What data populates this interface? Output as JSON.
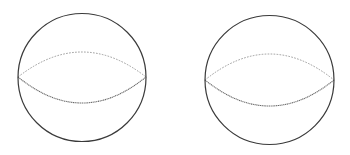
{
  "diagram": {
    "title": "Two spheres with equator",
    "colors": {
      "background": "#ffffff",
      "outline": "#3a3a3a",
      "back_equator": "#9a9a9a",
      "front_equator": "#6a6a6a"
    },
    "spheres": [
      {
        "label": "sphere-1",
        "cx": 82,
        "cy": 77.5,
        "r": 64,
        "equator": {
          "left": [
            18,
            77
          ],
          "right": [
            146,
            77
          ],
          "back_ctrl_y": 27,
          "front_ctrl_y": 129
        }
      },
      {
        "label": "sphere-2",
        "cx": 269.5,
        "cy": 80,
        "r": 64.5,
        "equator": {
          "left": [
            205,
            80
          ],
          "right": [
            334,
            80
          ],
          "back_ctrl_y": 28,
          "front_ctrl_y": 132
        }
      }
    ]
  }
}
